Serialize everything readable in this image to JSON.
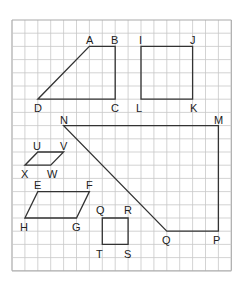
{
  "grid": {
    "origin_x": 12,
    "origin_y": 20,
    "cell_w": 12.9,
    "cell_h": 13.2,
    "cols": 17,
    "rows": 19,
    "line_color": "#c8c8c8",
    "border_color": "#aaaaaa"
  },
  "shape_color": "#333333",
  "shapes": [
    {
      "name": "trapezoid-ABCD",
      "points": [
        [
          "A",
          6,
          2
        ],
        [
          "B",
          8,
          2
        ],
        [
          "C",
          8,
          6
        ],
        [
          "D",
          2,
          6
        ]
      ]
    },
    {
      "name": "square-IJKL",
      "points": [
        [
          "I",
          10,
          2
        ],
        [
          "J",
          14,
          2
        ],
        [
          "K",
          14,
          6
        ],
        [
          "L",
          10,
          6
        ]
      ]
    },
    {
      "name": "trapezoid-NMPQ",
      "points": [
        [
          "N",
          4,
          8
        ],
        [
          "M",
          16,
          8
        ],
        [
          "P",
          16,
          16
        ],
        [
          "Q",
          12,
          16
        ]
      ]
    },
    {
      "name": "parallelogram-UVWX",
      "points": [
        [
          "U",
          2,
          10
        ],
        [
          "V",
          4,
          10
        ],
        [
          "W",
          3,
          11
        ],
        [
          "X",
          1,
          11
        ]
      ]
    },
    {
      "name": "parallelogram-EFGH",
      "points": [
        [
          "E",
          2,
          13
        ],
        [
          "F",
          6,
          13
        ],
        [
          "G",
          5,
          15
        ],
        [
          "H",
          1,
          15
        ]
      ]
    },
    {
      "name": "square-QRST",
      "points": [
        [
          "Q",
          7,
          15
        ],
        [
          "R",
          9,
          15
        ],
        [
          "S",
          9,
          17
        ],
        [
          "T",
          7,
          17
        ]
      ]
    }
  ],
  "labels": [
    {
      "text": "A",
      "x": 86,
      "y": 44
    },
    {
      "text": "B",
      "x": 111,
      "y": 44
    },
    {
      "text": "C",
      "x": 111,
      "y": 112
    },
    {
      "text": "D",
      "x": 34,
      "y": 112
    },
    {
      "text": "I",
      "x": 139,
      "y": 44
    },
    {
      "text": "J",
      "x": 190,
      "y": 44
    },
    {
      "text": "K",
      "x": 190,
      "y": 112
    },
    {
      "text": "L",
      "x": 136,
      "y": 112
    },
    {
      "text": "N",
      "x": 60,
      "y": 124
    },
    {
      "text": "M",
      "x": 214,
      "y": 124
    },
    {
      "text": "P",
      "x": 213,
      "y": 244
    },
    {
      "text": "Q",
      "x": 162,
      "y": 244
    },
    {
      "text": "U",
      "x": 33,
      "y": 150
    },
    {
      "text": "V",
      "x": 60,
      "y": 150
    },
    {
      "text": "W",
      "x": 47,
      "y": 178
    },
    {
      "text": "X",
      "x": 21,
      "y": 178
    },
    {
      "text": "E",
      "x": 34,
      "y": 189
    },
    {
      "text": "F",
      "x": 86,
      "y": 189
    },
    {
      "text": "G",
      "x": 72,
      "y": 231
    },
    {
      "text": "H",
      "x": 20,
      "y": 231
    },
    {
      "text": "Q",
      "x": 96,
      "y": 214
    },
    {
      "text": "R",
      "x": 124,
      "y": 214
    },
    {
      "text": "S",
      "x": 124,
      "y": 258
    },
    {
      "text": "T",
      "x": 96,
      "y": 258
    }
  ]
}
